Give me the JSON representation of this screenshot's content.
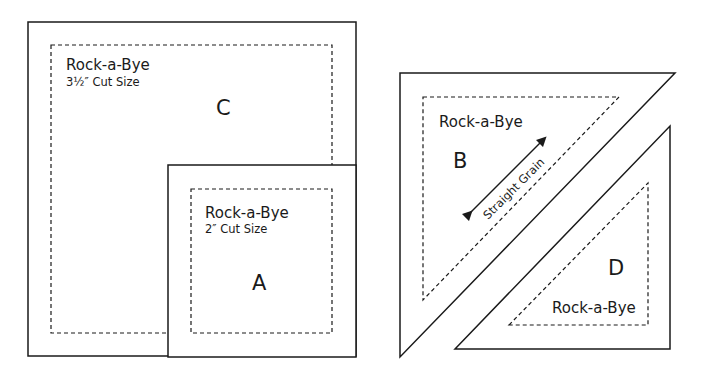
{
  "diagram": {
    "pieces": [
      {
        "id": "C",
        "shape": "square",
        "name": "Rock-a-Bye",
        "cut_size": "3½″ Cut Size",
        "letter": "C"
      },
      {
        "id": "A",
        "shape": "square",
        "name": "Rock-a-Bye",
        "cut_size": "2″ Cut Size",
        "letter": "A"
      },
      {
        "id": "B",
        "shape": "half-square-triangle",
        "name": "Rock-a-Bye",
        "letter": "B",
        "grain_label": "Straight Grain"
      },
      {
        "id": "D",
        "shape": "half-square-triangle",
        "name": "Rock-a-Bye",
        "letter": "D"
      }
    ],
    "colors": {
      "stroke": "#1a1a1a",
      "background": "#ffffff"
    }
  }
}
